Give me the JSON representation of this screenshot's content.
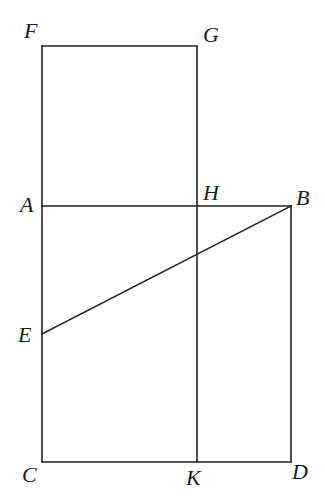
{
  "figure": {
    "type": "geometric-construction",
    "points": {
      "F": "F",
      "G": "G",
      "A": "A",
      "H": "H",
      "B": "B",
      "E": "E",
      "C": "C",
      "K": "K",
      "D": "D"
    },
    "segments": [
      [
        "F",
        "G"
      ],
      [
        "F",
        "A"
      ],
      [
        "G",
        "H"
      ],
      [
        "A",
        "B"
      ],
      [
        "B",
        "D"
      ],
      [
        "A",
        "C"
      ],
      [
        "C",
        "D"
      ],
      [
        "H",
        "K"
      ],
      [
        "E",
        "B"
      ]
    ]
  }
}
